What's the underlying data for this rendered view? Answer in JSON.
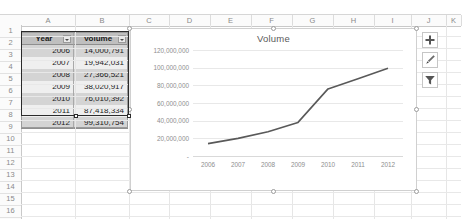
{
  "app": {
    "name": "spreadsheet-chart-view"
  },
  "grid": {
    "columns": [
      {
        "label": "A",
        "left": 21,
        "width": 54
      },
      {
        "label": "B",
        "left": 75,
        "width": 54
      },
      {
        "label": "C",
        "left": 129,
        "width": 40
      },
      {
        "label": "D",
        "left": 169,
        "width": 41
      },
      {
        "label": "E",
        "left": 210,
        "width": 41
      },
      {
        "label": "F",
        "left": 251,
        "width": 41
      },
      {
        "label": "G",
        "left": 292,
        "width": 41
      },
      {
        "label": "H",
        "left": 333,
        "width": 41
      },
      {
        "label": "I",
        "left": 374,
        "width": 37
      },
      {
        "label": "J",
        "left": 411,
        "width": 35
      },
      {
        "label": "K",
        "left": 446,
        "width": 15
      }
    ],
    "rows": [
      "1",
      "2",
      "3",
      "4",
      "5",
      "6",
      "7",
      "8",
      "9",
      "10",
      "11",
      "12",
      "13",
      "14",
      "15",
      "16"
    ]
  },
  "table": {
    "headers": [
      "Year",
      "Volume"
    ],
    "filter_icon": "filter-dropdown-icon",
    "rows": [
      {
        "year": "2006",
        "volume": "14,000,791"
      },
      {
        "year": "2007",
        "volume": "19,942,031"
      },
      {
        "year": "2008",
        "volume": "27,366,521"
      },
      {
        "year": "2009",
        "volume": "38,020,917"
      },
      {
        "year": "2010",
        "volume": "76,010,392"
      },
      {
        "year": "2011",
        "volume": "87,418,334"
      },
      {
        "year": "2012",
        "volume": "99,310,754"
      }
    ]
  },
  "chart_buttons": [
    {
      "name": "chart-elements-button",
      "icon": "plus-icon"
    },
    {
      "name": "chart-styles-button",
      "icon": "paintbrush-icon"
    },
    {
      "name": "chart-filters-button",
      "icon": "funnel-icon"
    }
  ],
  "chart_data": {
    "type": "line",
    "title": "Volume",
    "xlabel": "",
    "ylabel": "",
    "categories": [
      "2006",
      "2007",
      "2008",
      "2009",
      "2010",
      "2011",
      "2012"
    ],
    "series": [
      {
        "name": "Volume",
        "values": [
          14000791,
          19942031,
          27366521,
          38020917,
          76010392,
          87418334,
          99310754
        ],
        "color": "#595959"
      }
    ],
    "ylim": [
      0,
      120000000
    ],
    "yticks": [
      0,
      20000000,
      40000000,
      60000000,
      80000000,
      100000000,
      120000000
    ],
    "ytick_labels": [
      "-",
      "20,000,000",
      "40,000,000",
      "60,000,000",
      "80,000,000",
      "100,000,000",
      "120,000,000"
    ],
    "grid": true,
    "legend": false,
    "legend_position": "none"
  }
}
